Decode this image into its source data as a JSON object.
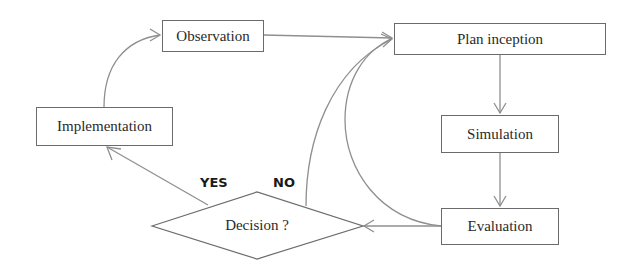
{
  "diagram": {
    "nodes": {
      "observation": "Observation",
      "plan_inception": "Plan inception",
      "simulation": "Simulation",
      "evaluation": "Evaluation",
      "implementation": "Implementation",
      "decision": "Decision ?"
    },
    "edge_labels": {
      "yes": "YES",
      "no": "NO"
    },
    "edges": [
      {
        "from": "Observation",
        "to": "Plan inception"
      },
      {
        "from": "Plan inception",
        "to": "Simulation"
      },
      {
        "from": "Simulation",
        "to": "Evaluation"
      },
      {
        "from": "Evaluation",
        "to": "Decision ?"
      },
      {
        "from": "Evaluation",
        "to": "Plan inception"
      },
      {
        "from": "Decision ?",
        "to": "Plan inception",
        "label": "NO"
      },
      {
        "from": "Decision ?",
        "to": "Implementation",
        "label": "YES"
      },
      {
        "from": "Implementation",
        "to": "Observation"
      }
    ],
    "colors": {
      "line": "#8a8a8a",
      "border": "#6b6b6b",
      "text": "#2a2a2a"
    }
  }
}
